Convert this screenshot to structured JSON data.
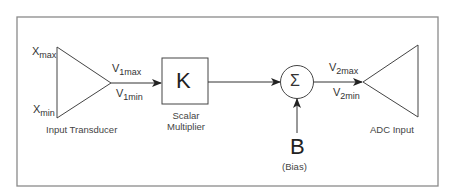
{
  "diagram": {
    "frame_color": "#8a8a8a",
    "line_color": "#333333",
    "nodes": {
      "input_transducer": {
        "caption": "Input Transducer",
        "input_max": {
          "base": "X",
          "sub": "max"
        },
        "input_min": {
          "base": "X",
          "sub": "min"
        },
        "output_max": {
          "base": "V",
          "sub": "1max"
        },
        "output_min": {
          "base": "V",
          "sub": "1min"
        }
      },
      "scalar_multiplier": {
        "symbol": "K",
        "caption_line1": "Scalar",
        "caption_line2": "Multiplier"
      },
      "summing_junction": {
        "symbol": "Σ",
        "output_max": {
          "base": "V",
          "sub": "2max"
        },
        "output_min": {
          "base": "V",
          "sub": "2min"
        }
      },
      "bias": {
        "symbol": "B",
        "caption": "(Bias)"
      },
      "adc_input": {
        "caption": "ADC Input"
      }
    },
    "edges": [
      {
        "from": "input_transducer",
        "to": "scalar_multiplier"
      },
      {
        "from": "scalar_multiplier",
        "to": "summing_junction"
      },
      {
        "from": "bias",
        "to": "summing_junction"
      },
      {
        "from": "summing_junction",
        "to": "adc_input"
      }
    ]
  }
}
